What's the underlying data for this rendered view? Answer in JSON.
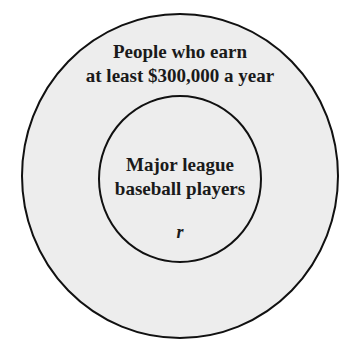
{
  "diagram": {
    "type": "euler",
    "outer_set": {
      "label_lines": [
        "People who earn",
        "at least $300,000 a year"
      ],
      "fill": "#ededed",
      "stroke": "#111111"
    },
    "inner_set": {
      "label_lines": [
        "Major league",
        "baseball players"
      ],
      "element_label": "r",
      "fill": "#ededed",
      "stroke": "#111111"
    },
    "relationship": "Major league baseball players is a subset of People who earn at least $300,000 a year; element r lies in the inner set"
  }
}
